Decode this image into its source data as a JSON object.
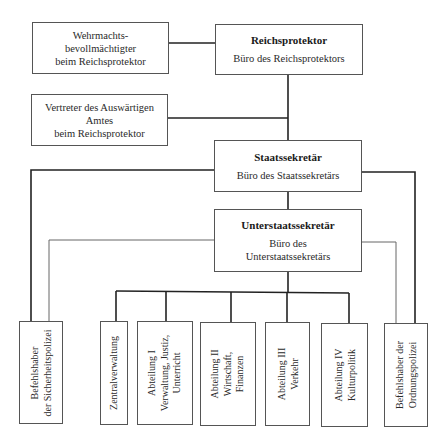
{
  "diagram": {
    "top": {
      "wehrmacht": {
        "lines": [
          "Wehrmachts-",
          "bevollmächtigter",
          "beim Reichsprotektor"
        ]
      },
      "reichsprotektor": {
        "title": "Reichsprotektor",
        "sub": "Büro des Reichsprotektors"
      },
      "vertreter": {
        "lines": [
          "Vertreter des Auswärtigen",
          "Amtes",
          "beim Reichsprotektor"
        ]
      },
      "staatssekretaer": {
        "title": "Staatssekretär",
        "sub": "Büro des Staatssekretärs"
      },
      "unterstaatssekretaer": {
        "title": "Unterstaatssekretär",
        "sub1": "Büro des",
        "sub2": "Unterstaatssekretärs"
      }
    },
    "bottom": [
      {
        "id": "sicherheitspolizei",
        "lines": [
          "Befehlshaber",
          "der Sicherheitspolizei"
        ]
      },
      {
        "id": "zentralverwaltung",
        "lines": [
          "Zentralverwaltung"
        ]
      },
      {
        "id": "abteilung-1",
        "lines": [
          "Abteilung I",
          "Verwaltung, Justiz,",
          "Unterricht"
        ]
      },
      {
        "id": "abteilung-2",
        "lines": [
          "Abteilung II",
          "Wirtschaft,",
          "Finanzen"
        ]
      },
      {
        "id": "abteilung-3",
        "lines": [
          "Abteilung III",
          "Verkehr"
        ]
      },
      {
        "id": "abteilung-4",
        "lines": [
          "Abteilung IV",
          "Kulturpolitik"
        ]
      },
      {
        "id": "ordnungspolizei",
        "lines": [
          "Befehlshaber der",
          "Ordnungspolizei"
        ]
      }
    ]
  }
}
